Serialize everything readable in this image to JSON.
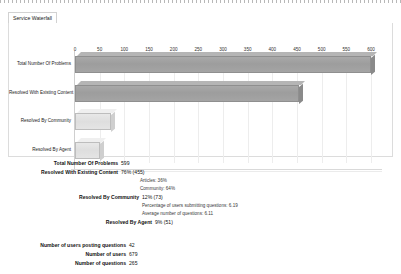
{
  "tab": {
    "label": "Service Waterfall"
  },
  "chart_data": {
    "type": "bar",
    "orientation": "horizontal",
    "title": "",
    "xlabel": "",
    "ylabel": "",
    "grid": true,
    "legend": "none",
    "xlim": [
      0,
      600
    ],
    "categories": [
      "Total Number Of Problems",
      "Resolved With Existing Content",
      "Resolved By Community",
      "Resolved By Agent"
    ],
    "values": [
      599,
      455,
      73,
      51
    ],
    "tick_labels": [
      "0",
      "50",
      "100",
      "150",
      "200",
      "250",
      "300",
      "350",
      "400",
      "450",
      "500",
      "550",
      "600"
    ],
    "tick_values": [
      0,
      50,
      100,
      150,
      200,
      250,
      300,
      350,
      400,
      450,
      500,
      550,
      600
    ],
    "series": [
      {
        "name": "Problems",
        "values": [
          599,
          455,
          73,
          51
        ]
      }
    ],
    "bar_styles": [
      "dark",
      "dark",
      "light",
      "light"
    ]
  },
  "summary": {
    "rows": [
      {
        "label": "Total Number Of Problems",
        "value": "599"
      },
      {
        "label": "Resolved With Existing Content",
        "value": "76% (455)"
      },
      {
        "label": "Articles: 36%",
        "value": ""
      },
      {
        "label": "Community: 64%",
        "value": ""
      },
      {
        "label": "Resolved By Community",
        "value": "12% (73)"
      },
      {
        "label": "Percentage of users submitting questions: 6.19",
        "value": ""
      },
      {
        "label": "Average number of questions: 6.11",
        "value": ""
      },
      {
        "label": "Resolved By Agent",
        "value": "9% (51)"
      }
    ],
    "footer": [
      {
        "label": "Number of users posting questions",
        "value": "42"
      },
      {
        "label": "Number of users",
        "value": "679"
      },
      {
        "label": "Number of questions",
        "value": "265"
      }
    ]
  },
  "colors": {
    "bar_dark": "#9d9d9d",
    "bar_light": "#dedede",
    "grid": "#ededed",
    "panel": "#ffffff",
    "text": "#111111"
  }
}
